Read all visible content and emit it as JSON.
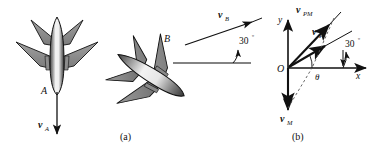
{
  "figure": {
    "panels": [
      {
        "caption": "(a)",
        "description": "Two aircraft in plan view; aircraft A flying downward with velocity vA, aircraft B flying up-right at 30 degrees with velocity vB",
        "labels": {
          "plane_a": "A",
          "plane_b": "B",
          "velocity_a": "v",
          "velocity_a_sub": "A",
          "velocity_b": "v",
          "velocity_b_sub": "B",
          "angle_b": "30",
          "angle_b_unit": "º"
        }
      },
      {
        "caption": "(b)",
        "description": "Vector diagram on x-y axes showing vP, vPM, vM and angles theta and 30 degrees",
        "labels": {
          "origin": "O",
          "axis_x": "x",
          "axis_y": "y",
          "vector_pm": "v",
          "vector_pm_sub": "PM",
          "vector_p": "v",
          "vector_p_sub": "P",
          "vector_m": "v",
          "vector_m_sub": "M",
          "angle_theta": "θ",
          "angle_30": "30",
          "angle_30_unit": "º"
        }
      }
    ]
  },
  "colors": {
    "stroke": "#111111",
    "wing_fill": "#8a8a8a",
    "wing_fill_dark": "#6e6e6e",
    "fuselage_light": "#f2f2f2",
    "fuselage_mid": "#9a9a9a",
    "fuselage_dark": "#3c3c3c",
    "background": "#ffffff"
  }
}
